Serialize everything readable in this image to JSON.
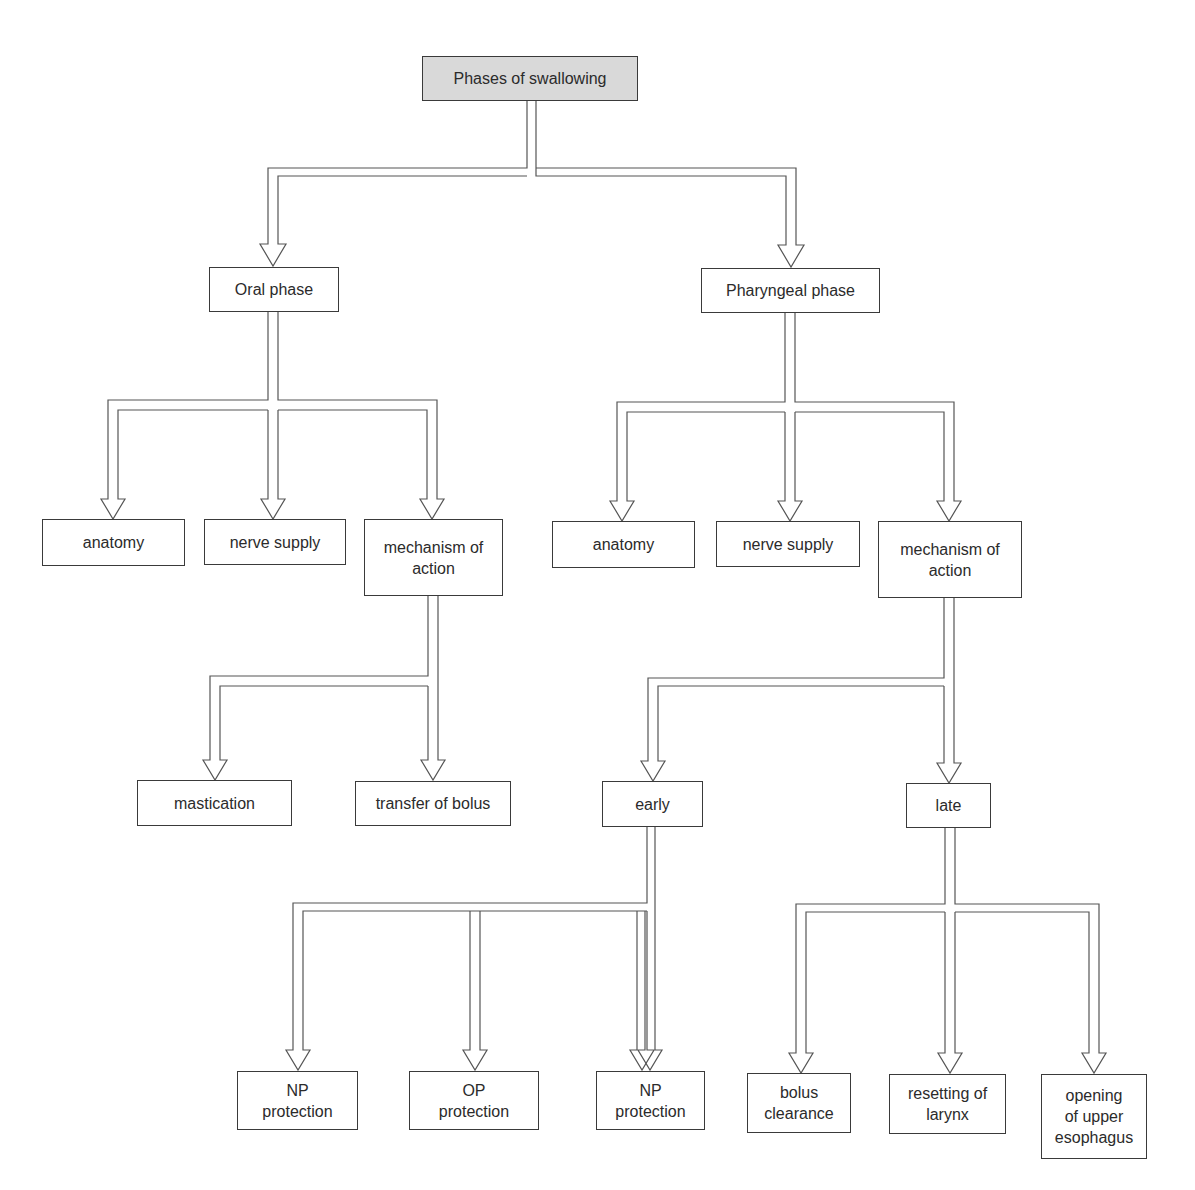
{
  "diagram": {
    "title": "Phases of swallowing",
    "colors": {
      "root_fill": "#d9d9d9",
      "box_border": "#3a3a3a",
      "text": "#2b2b2b",
      "arrow_stroke": "#555555"
    },
    "nodes": {
      "root": {
        "label": "Phases of swallowing"
      },
      "oral": {
        "label": "Oral phase"
      },
      "pharyngeal": {
        "label": "Pharyngeal phase"
      },
      "oral_anatomy": {
        "label": "anatomy"
      },
      "oral_nerve": {
        "label": "nerve supply"
      },
      "oral_mechanism": {
        "label": "mechanism of\naction"
      },
      "pharyngeal_anatomy": {
        "label": "anatomy"
      },
      "pharyngeal_nerve": {
        "label": "nerve supply"
      },
      "pharyngeal_mechanism": {
        "label": "mechanism of\naction"
      },
      "mastication": {
        "label": "mastication"
      },
      "transfer": {
        "label": "transfer of bolus"
      },
      "early": {
        "label": "early"
      },
      "late": {
        "label": "late"
      },
      "early_np1": {
        "label": "NP\nprotection"
      },
      "early_op": {
        "label": "OP\nprotection"
      },
      "early_np2": {
        "label": "NP\nprotection"
      },
      "late_bolus": {
        "label": "bolus\nclearance"
      },
      "late_resetting": {
        "label": "resetting of\nlarynx"
      },
      "late_opening": {
        "label": "opening\nof upper\nesophagus"
      }
    },
    "edges": [
      [
        "root",
        "oral"
      ],
      [
        "root",
        "pharyngeal"
      ],
      [
        "oral",
        "oral_anatomy"
      ],
      [
        "oral",
        "oral_nerve"
      ],
      [
        "oral",
        "oral_mechanism"
      ],
      [
        "pharyngeal",
        "pharyngeal_anatomy"
      ],
      [
        "pharyngeal",
        "pharyngeal_nerve"
      ],
      [
        "pharyngeal",
        "pharyngeal_mechanism"
      ],
      [
        "oral_mechanism",
        "mastication"
      ],
      [
        "oral_mechanism",
        "transfer"
      ],
      [
        "pharyngeal_mechanism",
        "early"
      ],
      [
        "pharyngeal_mechanism",
        "late"
      ],
      [
        "early",
        "early_np1"
      ],
      [
        "early",
        "early_op"
      ],
      [
        "early",
        "early_np2"
      ],
      [
        "late",
        "late_bolus"
      ],
      [
        "late",
        "late_resetting"
      ],
      [
        "late",
        "late_opening"
      ]
    ]
  }
}
